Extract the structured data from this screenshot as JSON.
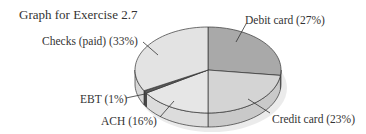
{
  "chart_data": {
    "type": "pie",
    "title": "Graph for Exercise 2.7",
    "categories": [
      "Debit card",
      "Credit card",
      "ACH",
      "EBT",
      "Checks (paid)"
    ],
    "values": [
      27,
      23,
      16,
      1,
      33
    ],
    "unit": "%",
    "labels": [
      "Debit card (27%)",
      "Credit card (23%)",
      "ACH (16%)",
      "EBT (1%)",
      "Checks (paid) (33%)"
    ],
    "colors": [
      "#a9a9a9",
      "#d4d4d4",
      "#e6e6e6",
      "#5a5a5a",
      "#e3e3e3"
    ],
    "side_colors": [
      "#9a9a9a",
      "#c9c9c9",
      "#dcdcdc",
      "#4a4a4a",
      "#d8d8d8"
    ],
    "style": "3d",
    "start_angle_deg": 0,
    "direction": "clockwise",
    "legend": "none"
  },
  "labels": {
    "title": "Graph for Exercise 2.7",
    "debit": "Debit card (27%)",
    "credit": "Credit card (23%)",
    "ach": "ACH (16%)",
    "ebt": "EBT (1%)",
    "checks": "Checks (paid) (33%)"
  }
}
